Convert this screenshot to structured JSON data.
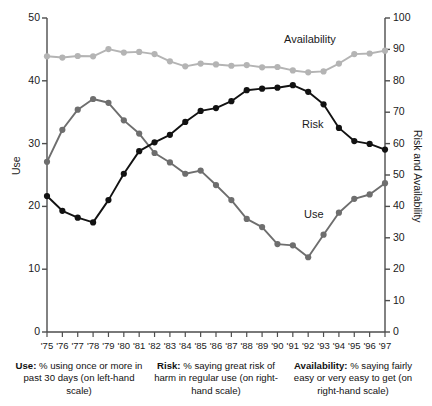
{
  "chart_data": {
    "type": "line",
    "title": "",
    "xlabel": "",
    "ylabel": "Use",
    "y2label": "Risk and Availability",
    "ylim": [
      0,
      50
    ],
    "y2lim": [
      0,
      100
    ],
    "grid": false,
    "legend": "inline-annotations",
    "categories": [
      "'75",
      "'76",
      "'77",
      "'78",
      "'79",
      "'80",
      "'81",
      "'82",
      "'83",
      "'84",
      "'85",
      "'86",
      "'87",
      "'88",
      "'89",
      "'90",
      "'91",
      "'92",
      "'93",
      "'94",
      "'95",
      "'96",
      "'97"
    ],
    "ytick_labels_left": [
      "0",
      "10",
      "20",
      "30",
      "40",
      "50"
    ],
    "ytick_values_left": [
      0,
      10,
      20,
      30,
      40,
      50
    ],
    "ytick_labels_right": [
      "0",
      "10",
      "20",
      "30",
      "40",
      "50",
      "60",
      "70",
      "80",
      "90",
      "100"
    ],
    "ytick_values_right": [
      0,
      10,
      20,
      30,
      40,
      50,
      60,
      70,
      80,
      90,
      100
    ],
    "series": [
      {
        "name": "Use",
        "axis": "left",
        "color": "#6e6e6e",
        "annotation": "Use",
        "values": [
          27.1,
          32.2,
          35.4,
          37.1,
          36.5,
          33.7,
          31.6,
          28.5,
          27.0,
          25.2,
          25.7,
          23.4,
          21.0,
          18.0,
          16.7,
          14.0,
          13.8,
          11.9,
          15.5,
          19.0,
          21.2,
          21.9,
          23.7
        ]
      },
      {
        "name": "Risk",
        "axis": "right",
        "color": "#121212",
        "annotation": "Risk",
        "values": [
          43.3,
          38.6,
          36.4,
          34.9,
          42.0,
          50.4,
          57.6,
          60.4,
          62.8,
          66.9,
          70.4,
          71.3,
          73.5,
          77.0,
          77.5,
          77.8,
          78.6,
          76.5,
          72.5,
          65.0,
          60.8,
          59.9,
          58.1
        ]
      },
      {
        "name": "Availability",
        "axis": "right",
        "color": "#b4b4b4",
        "annotation": "Availability",
        "values": [
          87.8,
          87.4,
          87.9,
          87.8,
          90.1,
          89.0,
          89.2,
          88.5,
          86.2,
          84.6,
          85.5,
          85.2,
          84.8,
          85.0,
          84.3,
          84.4,
          83.3,
          82.7,
          83.0,
          85.5,
          88.5,
          88.7,
          89.6
        ]
      }
    ]
  },
  "annotations": {
    "use": "Use",
    "risk": "Risk",
    "availability": "Availability"
  },
  "caption": {
    "columns": [
      {
        "term": "Use:",
        "text": " % using once or more in past 30 days (on left-hand scale)"
      },
      {
        "term": "Risk:",
        "text": " % saying great risk of harm in regular use (on right-hand scale)"
      },
      {
        "term": "Availability:",
        "text": " % saying fairly easy or very easy to get (on right-hand scale)"
      }
    ]
  }
}
